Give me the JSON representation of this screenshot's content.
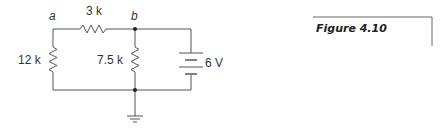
{
  "figure": {
    "caption": "Figure 4.10"
  },
  "circuit": {
    "nodes": [
      {
        "id": "a",
        "label": "a"
      },
      {
        "id": "b",
        "label": "b"
      }
    ],
    "components": [
      {
        "type": "resistor",
        "label": "3 k",
        "orientation": "horizontal",
        "between": "a-b"
      },
      {
        "type": "resistor",
        "label": "12 k",
        "orientation": "vertical",
        "position": "left"
      },
      {
        "type": "resistor",
        "label": "7.5 k",
        "orientation": "vertical",
        "position": "middle"
      },
      {
        "type": "battery",
        "label": "6 V",
        "orientation": "vertical",
        "position": "right"
      },
      {
        "type": "ground",
        "label": ""
      }
    ],
    "labels": {
      "node_a": "a",
      "node_b": "b",
      "r_series": "3 k",
      "r_left": "12 k",
      "r_mid": "7.5 k",
      "source": "6 V"
    }
  },
  "colors": {
    "wire": "#555555",
    "text": "#333333"
  }
}
